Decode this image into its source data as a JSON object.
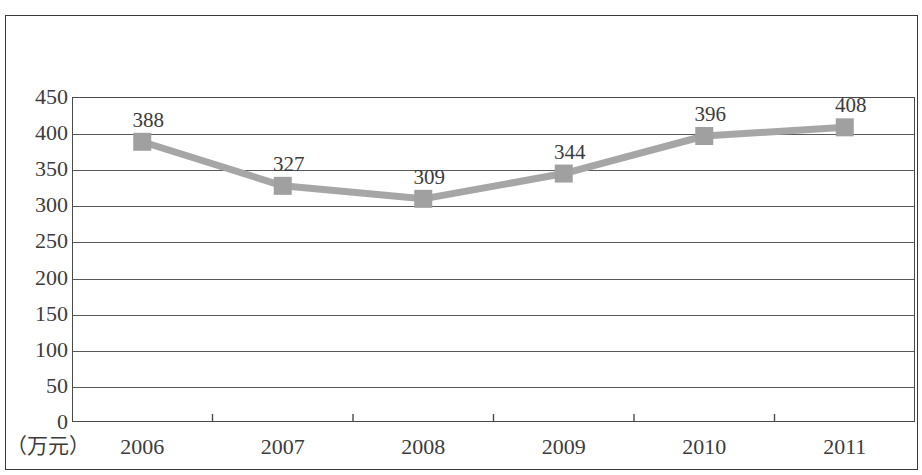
{
  "chart_data": {
    "type": "line",
    "title": "",
    "subtitle": "",
    "xlabel": "",
    "ylabel": "",
    "unit_label": "（万元）",
    "categories": [
      "2006",
      "2007",
      "2008",
      "2009",
      "2010",
      "2011"
    ],
    "values": [
      388,
      327,
      309,
      344,
      396,
      408
    ],
    "data_labels": [
      "388",
      "327",
      "309",
      "344",
      "396",
      "408"
    ],
    "series": [
      {
        "name": "",
        "values": [
          388,
          327,
          309,
          344,
          396,
          408
        ]
      }
    ],
    "ylim": [
      0,
      450
    ],
    "ytick_values": [
      0,
      50,
      100,
      150,
      200,
      250,
      300,
      350,
      400,
      450
    ],
    "ytick_labels": [
      "0",
      "50",
      "100",
      "150",
      "200",
      "250",
      "300",
      "350",
      "400",
      "450"
    ],
    "grid": true,
    "legend": false,
    "legend_position": "none",
    "marker": "square",
    "colors": {
      "line": "#a6a6a6",
      "marker": "#a0a0a0",
      "grid": "#5a5a5a",
      "axis": "#4a4a4a",
      "frame": "#3a3a3a",
      "text": "#3c3c3c",
      "background": "#ffffff"
    }
  }
}
